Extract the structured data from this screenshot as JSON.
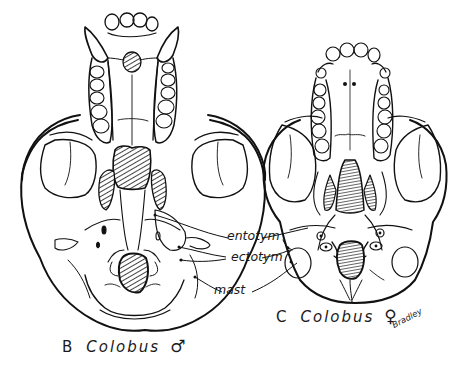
{
  "figure": {
    "type": "scientific illustration",
    "view": "ventral view of skulls",
    "panels": [
      {
        "id": "B",
        "letter": "B",
        "genus": "Colobus",
        "sex_symbol": "♂",
        "sex": "male"
      },
      {
        "id": "C",
        "letter": "C",
        "genus": "Colobus",
        "sex_symbol": "♀",
        "sex": "female"
      }
    ],
    "annotations": [
      {
        "id": "entotym",
        "text": "entotym"
      },
      {
        "id": "ectotym",
        "text": "ectotym"
      },
      {
        "id": "mast",
        "text": "mast"
      }
    ],
    "signature": "Bradley",
    "colors": {
      "ink": "#1a1a1a",
      "background": "#ffffff"
    }
  }
}
